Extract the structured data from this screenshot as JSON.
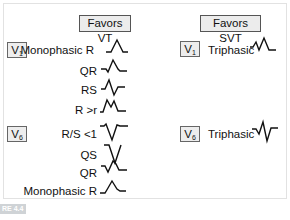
{
  "columns": {
    "vt": {
      "header": "Favors VT"
    },
    "svt": {
      "header": "Favors SVT"
    }
  },
  "vt": {
    "v1": {
      "lead": "V",
      "lead_sub": "1",
      "patterns": [
        {
          "label": "Monophasic R",
          "wave": "monophasic-r"
        },
        {
          "label": "QR",
          "wave": "qr"
        },
        {
          "label": "RS",
          "wave": "rs"
        },
        {
          "label": "R >r",
          "wave": "r-gt-r"
        }
      ]
    },
    "v6": {
      "lead": "V",
      "lead_sub": "6",
      "patterns": [
        {
          "label": "R/S <1",
          "wave": "rs-lt-1"
        },
        {
          "label": "QS",
          "wave": "qs"
        },
        {
          "label": "QR",
          "wave": "qr"
        },
        {
          "label": "Monophasic R",
          "wave": "monophasic-r"
        }
      ]
    }
  },
  "svt": {
    "v1": {
      "lead": "V",
      "lead_sub": "1",
      "label": "Triphasic",
      "wave": "triphasic-v1"
    },
    "v6": {
      "lead": "V",
      "lead_sub": "6",
      "label": "Triphasic",
      "wave": "triphasic-v6"
    }
  },
  "figure_tag": "RE 4.4"
}
